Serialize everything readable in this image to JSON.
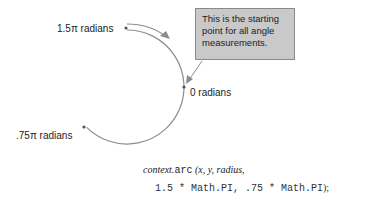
{
  "diagram": {
    "labels": {
      "start_angle": "1.5π radians",
      "zero": "0 radians",
      "end_angle": ".75π radians"
    },
    "callout": {
      "text": "This is the starting point for all angle measurements."
    },
    "code": {
      "line1_object": "context.",
      "line1_method": "arc",
      "line1_args": " (x, y, radius,",
      "line2": "1.5 * Math.PI, .75 * Math.PI",
      "line2_end": ");"
    },
    "colors": {
      "arc": "#8c8c8c",
      "callout_fill": "#c9c9c9",
      "callout_border": "#8a8a8a",
      "text": "#222222"
    },
    "geometry": {
      "center": [
        127,
        87
      ],
      "radius": 57,
      "start_angle_rad": "1.5π",
      "end_angle_rad": "0.75π"
    }
  }
}
